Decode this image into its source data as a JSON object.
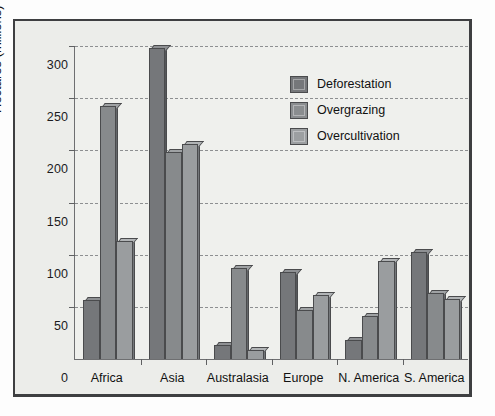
{
  "chart_data": {
    "type": "bar",
    "title": "",
    "subtitle": "",
    "xlabel": "",
    "ylabel": "Hectares (millions)",
    "ylim": [
      0,
      300
    ],
    "yticks": [
      0,
      50,
      100,
      150,
      200,
      250,
      300
    ],
    "ytick_labels": [
      "0",
      "50",
      "100",
      "150",
      "200",
      "250",
      "300"
    ],
    "grid": true,
    "grid_style": "dashed horizontal",
    "legend_position": "upper right inside plot",
    "categories": [
      "Africa",
      "Asia",
      "Australasia",
      "Europe",
      "N. America",
      "S. America"
    ],
    "series": [
      {
        "name": "Deforestation",
        "color": "#75777a",
        "values": [
          56,
          297,
          12,
          82,
          17,
          102
        ]
      },
      {
        "name": "Overgrazing",
        "color": "#8a8d8f",
        "values": [
          242,
          197,
          86,
          46,
          40,
          62
        ]
      },
      {
        "name": "Overcultivation",
        "color": "#9c9fa1",
        "values": [
          112,
          205,
          8,
          60,
          93,
          57
        ]
      }
    ],
    "annotations": []
  },
  "legend": {
    "entries": [
      {
        "label": "Deforestation"
      },
      {
        "label": "Overgrazing"
      },
      {
        "label": "Overcultivation"
      }
    ]
  }
}
